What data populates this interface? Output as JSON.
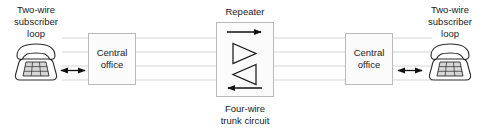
{
  "diagram": {
    "canvas": {
      "width": 487,
      "height": 134,
      "background": "#ffffff"
    },
    "colors": {
      "line": "#111111",
      "trunk_line": "#e3e3e3",
      "box_fill": "#fbfbfb",
      "box_border": "#b9b9b9",
      "text": "#1a1a1a",
      "phone_keypad": "#d6d6d6"
    },
    "labels": {
      "left_loop": {
        "line1": "Two-wire",
        "line2": "subscriber",
        "line3": "loop"
      },
      "right_loop": {
        "line1": "Two-wire",
        "line2": "subscriber",
        "line3": "loop"
      },
      "left_office": {
        "line1": "Central",
        "line2": "office"
      },
      "right_office": {
        "line1": "Central",
        "line2": "office"
      },
      "repeater": "Repeater",
      "trunk": {
        "line1": "Four-wire",
        "line2": "trunk circuit"
      }
    },
    "nodes": [
      {
        "id": "left-phone",
        "kind": "telephone-icon",
        "label": "Two-wire subscriber loop"
      },
      {
        "id": "left-central-office",
        "kind": "box",
        "label": "Central office"
      },
      {
        "id": "repeater",
        "kind": "box",
        "label": "Repeater"
      },
      {
        "id": "right-central-office",
        "kind": "box",
        "label": "Central office"
      },
      {
        "id": "right-phone",
        "kind": "telephone-icon",
        "label": "Two-wire subscriber loop"
      }
    ],
    "trunk_wires": {
      "count": 4,
      "y_positions": [
        38,
        52,
        66,
        80
      ]
    },
    "repeater_elements": [
      {
        "id": "top-direction-arrow",
        "glyph": "arrow-right",
        "meaning": "east-bound transmit path"
      },
      {
        "id": "east-amplifier",
        "glyph": "triangle-right",
        "meaning": "amplifier, east-bound"
      },
      {
        "id": "west-amplifier",
        "glyph": "triangle-left",
        "meaning": "amplifier, west-bound"
      },
      {
        "id": "bottom-direction-arrow",
        "glyph": "arrow-left",
        "meaning": "west-bound transmit path"
      }
    ],
    "subscriber_links": [
      {
        "id": "left-subscriber-link",
        "glyph": "double-headed-arrow",
        "meaning": "two-wire bidirectional loop"
      },
      {
        "id": "right-subscriber-link",
        "glyph": "double-headed-arrow",
        "meaning": "two-wire bidirectional loop"
      }
    ]
  }
}
